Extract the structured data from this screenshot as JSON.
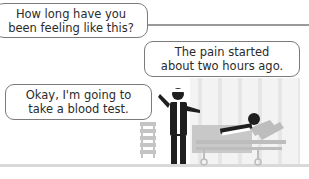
{
  "panel": {
    "type": "comic-illustration",
    "colors": {
      "frame": "#9a9a9a",
      "figure": "#1f1f1f",
      "accent_gray": "#b5b5b5",
      "background": "#ffffff"
    }
  },
  "bubbles": {
    "question": {
      "line1": "How long have you",
      "line2": "been feeling like this?"
    },
    "patient_reply": {
      "line1": "The pain started",
      "line2": "about two hours ago."
    },
    "doctor_reply": {
      "line1": "Okay, I'm going to",
      "line2": "take a blood test."
    }
  },
  "scene": {
    "figures": [
      "doctor-icon",
      "patient-on-bed-icon",
      "cabinet-icon",
      "hospital-bed-icon"
    ]
  }
}
